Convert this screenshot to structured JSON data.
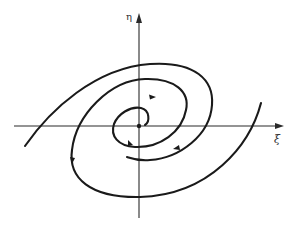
{
  "figure": {
    "type": "phase-portrait",
    "axes": {
      "horizontal_label": "ξ",
      "vertical_label": "η"
    },
    "equilibrium": "origin",
    "trajectory_count": 2,
    "flow_direction": "inward toward origin",
    "colors": {
      "background": "#ffffff",
      "ink": "#1a1a1a"
    }
  }
}
